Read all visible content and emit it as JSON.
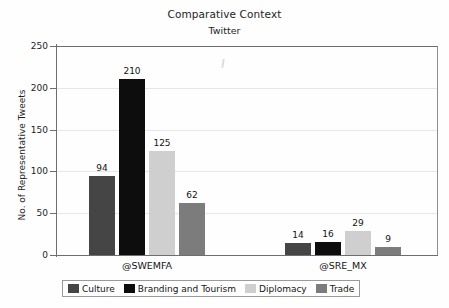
{
  "chart_data": {
    "type": "bar",
    "title": "Comparative Context",
    "subtitle": "Twitter",
    "xlabel": "",
    "ylabel": "No. of Representative Tweets",
    "ylim": [
      0,
      250
    ],
    "ytick_labels": [
      "0",
      "50",
      "100",
      "150",
      "200",
      "250"
    ],
    "ytick_values": [
      0,
      50,
      100,
      150,
      200,
      250
    ],
    "grid": "horizontal",
    "legend_position": "bottom",
    "categories": [
      "@SWEMFA",
      "@SRE_MX"
    ],
    "series": [
      {
        "name": "Culture",
        "color": "#454545",
        "values": [
          94,
          14
        ]
      },
      {
        "name": "Branding and Tourism",
        "color": "#0d0d0d",
        "values": [
          210,
          16
        ]
      },
      {
        "name": "Diplomacy",
        "color": "#cfcfcf",
        "values": [
          125,
          29
        ]
      },
      {
        "name": "Trade",
        "color": "#7c7c7c",
        "values": [
          62,
          9
        ]
      }
    ],
    "data_labels": [
      {
        "group": "@SWEMFA",
        "series": "Culture",
        "value": "94"
      },
      {
        "group": "@SWEMFA",
        "series": "Branding and Tourism",
        "value": "210"
      },
      {
        "group": "@SWEMFA",
        "series": "Diplomacy",
        "value": "125"
      },
      {
        "group": "@SWEMFA",
        "series": "Trade",
        "value": "62"
      },
      {
        "group": "@SRE_MX",
        "series": "Culture",
        "value": "14"
      },
      {
        "group": "@SRE_MX",
        "series": "Branding and Tourism",
        "value": "16"
      },
      {
        "group": "@SRE_MX",
        "series": "Diplomacy",
        "value": "29"
      },
      {
        "group": "@SRE_MX",
        "series": "Trade",
        "value": "9"
      }
    ]
  },
  "legend": {
    "items": [
      {
        "label": "Culture",
        "color": "#454545"
      },
      {
        "label": "Branding and Tourism",
        "color": "#0d0d0d"
      },
      {
        "label": "Diplomacy",
        "color": "#cfcfcf"
      },
      {
        "label": "Trade",
        "color": "#7c7c7c"
      }
    ]
  }
}
